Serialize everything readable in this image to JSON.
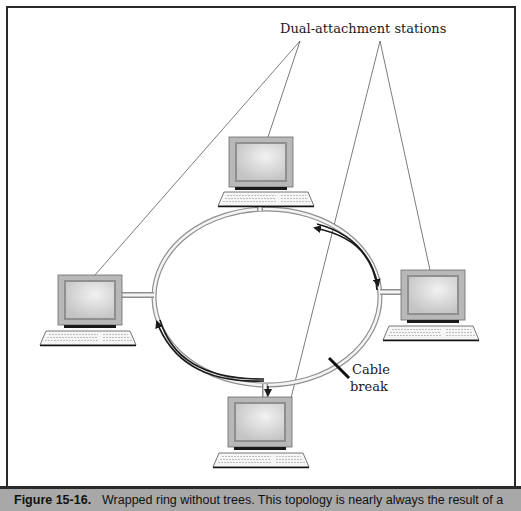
{
  "figure": {
    "callout_label": "Dual-attachment stations",
    "break_label_line1": "Cable",
    "break_label_line2": "break",
    "stations": [
      {
        "id": "top",
        "name": "top-station"
      },
      {
        "id": "left",
        "name": "left-station"
      },
      {
        "id": "right",
        "name": "right-station"
      },
      {
        "id": "bottom",
        "name": "bottom-station"
      }
    ],
    "colors": {
      "frame": "#2a2a2a",
      "ring_outer": "#9a9a9a",
      "ring_inner": "#f4f4f4",
      "wrap_path": "#1a1a1a",
      "monitor_case": "#b8b8b8",
      "monitor_screen": "#d6d6d6",
      "caption_bg": "#a8a8a8"
    }
  },
  "caption": {
    "number": "Figure 15-16.",
    "text": "Wrapped ring without trees. This topology is nearly always the result of a"
  }
}
